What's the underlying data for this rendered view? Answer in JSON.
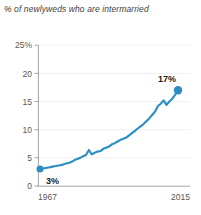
{
  "chart_data": {
    "type": "line",
    "title": "% of newlyweds who are intermarried",
    "xlabel": "",
    "ylabel": "",
    "ylim": [
      0,
      25
    ],
    "xlim": [
      1967,
      2015
    ],
    "grid": true,
    "legend": false,
    "y_ticks": [
      "25%",
      "20",
      "15",
      "10",
      "5",
      "0"
    ],
    "y_tick_values": [
      25,
      20,
      15,
      10,
      5,
      0
    ],
    "x_ticks": [
      "1967",
      "2015"
    ],
    "x_tick_values": [
      1967,
      2015
    ],
    "series": [
      {
        "name": "Newlyweds intermarried",
        "color": "#2a8ec4",
        "x": [
          1967,
          1968,
          1969,
          1970,
          1971,
          1972,
          1973,
          1974,
          1975,
          1976,
          1977,
          1978,
          1979,
          1980,
          1981,
          1982,
          1983,
          1984,
          1985,
          1986,
          1987,
          1988,
          1989,
          1990,
          1991,
          1992,
          1993,
          1994,
          1995,
          1996,
          1997,
          1998,
          1999,
          2000,
          2001,
          2002,
          2003,
          2004,
          2005,
          2006,
          2007,
          2008,
          2009,
          2010,
          2011,
          2012,
          2013,
          2014,
          2015
        ],
        "values": [
          3.0,
          3.1,
          3.2,
          3.3,
          3.4,
          3.5,
          3.6,
          3.7,
          3.8,
          4.0,
          4.1,
          4.3,
          4.6,
          4.8,
          5.0,
          5.3,
          5.5,
          6.4,
          5.6,
          5.9,
          6.1,
          6.2,
          6.6,
          6.8,
          7.0,
          7.4,
          7.6,
          7.9,
          8.2,
          8.4,
          8.6,
          9.0,
          9.4,
          9.8,
          10.2,
          10.6,
          11.0,
          11.5,
          12.0,
          12.6,
          13.2,
          14.2,
          14.6,
          15.2,
          14.4,
          15.0,
          15.5,
          16.2,
          17.0
        ]
      }
    ],
    "annotations": [
      {
        "label": "3%",
        "x": 1967,
        "y": 3,
        "position": "below-right"
      },
      {
        "label": "17%",
        "x": 2015,
        "y": 17,
        "position": "above-left"
      }
    ],
    "markers": [
      {
        "x": 1967,
        "y": 3,
        "color": "#2a8ec4"
      },
      {
        "x": 2015,
        "y": 17,
        "color": "#2a8ec4"
      }
    ]
  },
  "colors": {
    "accent": "#2a8ec4",
    "title_text": "#3d3d3d",
    "tick_text": "#58585a",
    "callout_text": "#1b1b1b",
    "gridline": "#e9e9e9",
    "axis": "#8d8d8d",
    "background": "#ffffff"
  }
}
